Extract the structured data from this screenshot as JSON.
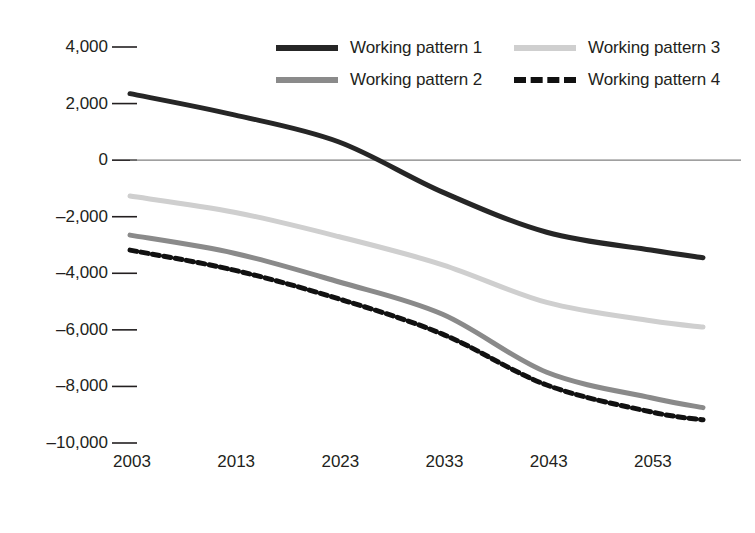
{
  "chart_data": {
    "type": "line",
    "title": "",
    "xlabel": "",
    "ylabel": "",
    "x": [
      2003,
      2013,
      2023,
      2033,
      2043,
      2053,
      2058
    ],
    "xtick_labels": [
      "2003",
      "2013",
      "2023",
      "2033",
      "2043",
      "2053"
    ],
    "xticks": [
      2003,
      2013,
      2023,
      2033,
      2043,
      2053
    ],
    "ytick_labels": [
      "4,000",
      "2,000",
      "0",
      "–2,000",
      "–4,000",
      "–6,000",
      "–8,000",
      "–10,000"
    ],
    "yticks": [
      4000,
      2000,
      0,
      -2000,
      -4000,
      -6000,
      -8000,
      -10000
    ],
    "ylim": [
      -10000,
      4000
    ],
    "xlim": [
      2003,
      2058
    ],
    "grid": false,
    "zero_line": true,
    "legend_position": "top-right",
    "series": [
      {
        "name": "Working pattern 1",
        "color": "#262626",
        "style": "solid",
        "width": 5,
        "values": [
          2350,
          1600,
          650,
          -1130,
          -2550,
          -3180,
          -3450
        ]
      },
      {
        "name": "Working pattern 2",
        "color": "#8a8a8a",
        "style": "solid",
        "width": 5,
        "values": [
          -2650,
          -3290,
          -4300,
          -5450,
          -7500,
          -8400,
          -8750
        ]
      },
      {
        "name": "Working pattern 3",
        "color": "#cfcfcf",
        "style": "solid",
        "width": 5,
        "values": [
          -1270,
          -1840,
          -2700,
          -3700,
          -5030,
          -5680,
          -5900
        ]
      },
      {
        "name": "Working pattern 4",
        "color": "#111111",
        "style": "dashed",
        "width": 5,
        "values": [
          -3180,
          -3890,
          -4900,
          -6150,
          -7950,
          -8900,
          -9180
        ]
      }
    ],
    "legend_entries": [
      "Working pattern 1",
      "Working pattern 3",
      "Working pattern 2",
      "Working pattern 4"
    ]
  }
}
